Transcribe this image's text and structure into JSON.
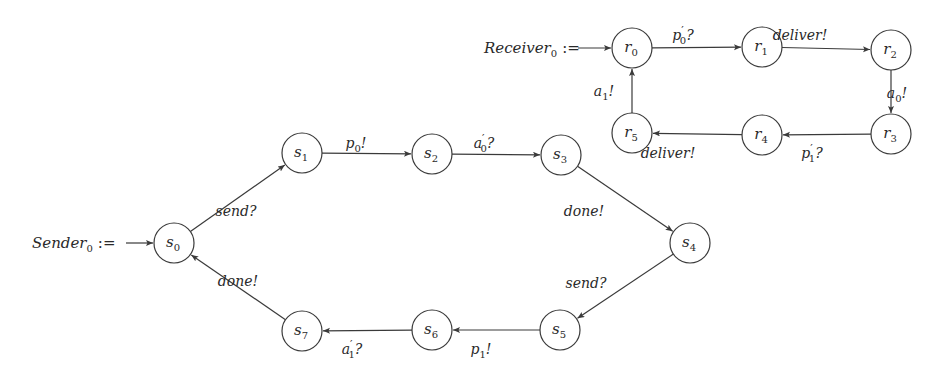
{
  "diagram": {
    "stroke_color": "#3a3a3a",
    "node_radius": 20,
    "automata": [
      {
        "name": "sender",
        "init_label": {
          "base": "Sender",
          "sub": "0",
          "op": ":=",
          "x": 32,
          "y": 248,
          "arrow_from": [
            126,
            243
          ]
        },
        "initial_state": "s0",
        "nodes": [
          {
            "id": "s0",
            "base": "s",
            "sub": "0",
            "x": 174,
            "y": 243
          },
          {
            "id": "s1",
            "base": "s",
            "sub": "1",
            "x": 302,
            "y": 153
          },
          {
            "id": "s2",
            "base": "s",
            "sub": "2",
            "x": 432,
            "y": 154
          },
          {
            "id": "s3",
            "base": "s",
            "sub": "3",
            "x": 561,
            "y": 155
          },
          {
            "id": "s4",
            "base": "s",
            "sub": "4",
            "x": 690,
            "y": 243
          },
          {
            "id": "s5",
            "base": "s",
            "sub": "5",
            "x": 560,
            "y": 330
          },
          {
            "id": "s6",
            "base": "s",
            "sub": "6",
            "x": 432,
            "y": 330
          },
          {
            "id": "s7",
            "base": "s",
            "sub": "7",
            "x": 302,
            "y": 331
          }
        ],
        "edges": [
          {
            "from": "s0",
            "to": "s1",
            "label": {
              "base": "send",
              "sub": "",
              "prime": false,
              "suffix": "?"
            },
            "lx": 236,
            "ly": 216
          },
          {
            "from": "s1",
            "to": "s2",
            "label": {
              "base": "p",
              "sub": "0",
              "prime": false,
              "suffix": "!"
            },
            "lx": 356,
            "ly": 148
          },
          {
            "from": "s2",
            "to": "s3",
            "label": {
              "base": "a",
              "sub": "0",
              "prime": true,
              "suffix": "?"
            },
            "lx": 484,
            "ly": 148
          },
          {
            "from": "s3",
            "to": "s4",
            "label": {
              "base": "done",
              "sub": "",
              "prime": false,
              "suffix": "!"
            },
            "lx": 584,
            "ly": 216
          },
          {
            "from": "s4",
            "to": "s5",
            "label": {
              "base": "send",
              "sub": "",
              "prime": false,
              "suffix": "?"
            },
            "lx": 586,
            "ly": 288
          },
          {
            "from": "s5",
            "to": "s6",
            "label": {
              "base": "p",
              "sub": "1",
              "prime": false,
              "suffix": "!"
            },
            "lx": 481,
            "ly": 354
          },
          {
            "from": "s6",
            "to": "s7",
            "label": {
              "base": "a",
              "sub": "1",
              "prime": true,
              "suffix": "?"
            },
            "lx": 352,
            "ly": 354
          },
          {
            "from": "s7",
            "to": "s0",
            "label": {
              "base": "done",
              "sub": "",
              "prime": false,
              "suffix": "!"
            },
            "lx": 238,
            "ly": 286
          }
        ]
      },
      {
        "name": "receiver",
        "init_label": {
          "base": "Receiver",
          "sub": "0",
          "op": ":=",
          "x": 484,
          "y": 53,
          "arrow_from": [
            578,
            48
          ]
        },
        "initial_state": "r0",
        "nodes": [
          {
            "id": "r0",
            "base": "r",
            "sub": "0",
            "x": 632,
            "y": 48
          },
          {
            "id": "r1",
            "base": "r",
            "sub": "1",
            "x": 762,
            "y": 47
          },
          {
            "id": "r2",
            "base": "r",
            "sub": "2",
            "x": 891,
            "y": 50
          },
          {
            "id": "r3",
            "base": "r",
            "sub": "3",
            "x": 891,
            "y": 134
          },
          {
            "id": "r4",
            "base": "r",
            "sub": "4",
            "x": 762,
            "y": 135
          },
          {
            "id": "r5",
            "base": "r",
            "sub": "5",
            "x": 632,
            "y": 133
          }
        ],
        "edges": [
          {
            "from": "r0",
            "to": "r1",
            "label": {
              "base": "p",
              "sub": "0",
              "prime": true,
              "suffix": "?"
            },
            "lx": 683,
            "ly": 40
          },
          {
            "from": "r1",
            "to": "r2",
            "label": {
              "base": "deliver",
              "sub": "",
              "prime": false,
              "suffix": "!"
            },
            "lx": 800,
            "ly": 40
          },
          {
            "from": "r2",
            "to": "r3",
            "label": {
              "base": "a",
              "sub": "0",
              "prime": false,
              "suffix": "!"
            },
            "lx": 897,
            "ly": 98
          },
          {
            "from": "r3",
            "to": "r4",
            "label": {
              "base": "p",
              "sub": "1",
              "prime": true,
              "suffix": "?"
            },
            "lx": 812,
            "ly": 158
          },
          {
            "from": "r4",
            "to": "r5",
            "label": {
              "base": "deliver",
              "sub": "",
              "prime": false,
              "suffix": "!"
            },
            "lx": 668,
            "ly": 158
          },
          {
            "from": "r5",
            "to": "r0",
            "label": {
              "base": "a",
              "sub": "1",
              "prime": false,
              "suffix": "!"
            },
            "lx": 604,
            "ly": 96
          }
        ]
      }
    ]
  }
}
